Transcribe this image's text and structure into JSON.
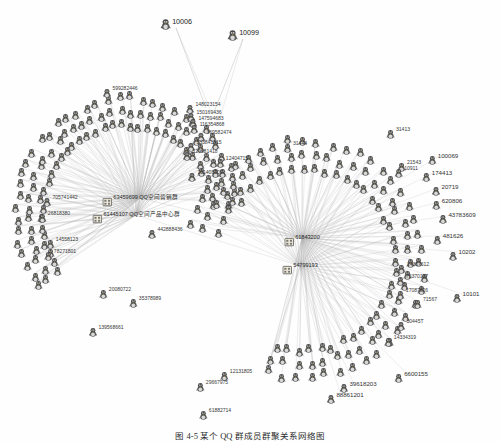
{
  "figure": {
    "type": "network-graph",
    "background": "#ffffff",
    "edge_color": "#b9b9b9",
    "node_color": "#555555",
    "label_color": "#3a3a3a",
    "caption": "图 4-5  某个 QQ 群成员群聚关系网络图"
  },
  "chart_data": {
    "type": "network",
    "layout": "two radial hub-and-spoke clusters",
    "hub_count": 4,
    "node_count": 236,
    "hubs": [
      {
        "id": "63459699",
        "label": "63459699  QQ空间营销群",
        "x": 140,
        "y": 198,
        "cluster": "left"
      },
      {
        "id": "61445107",
        "label": "61445107  QQ空间产品中心群",
        "x": 136,
        "y": 215,
        "cluster": "left"
      },
      {
        "id": "61843200",
        "label": "61843200",
        "x": 302,
        "y": 238,
        "cluster": "right"
      },
      {
        "id": "54799193",
        "label": "54799193",
        "x": 300,
        "y": 266,
        "cluster": "right"
      }
    ],
    "isolated_top": [
      {
        "id": "10006",
        "x": 176,
        "y": 22
      },
      {
        "id": "10099",
        "x": 243,
        "y": 33
      }
    ],
    "labelled_peripheral": [
      "599282446",
      "148023154",
      "150169436",
      "147594683",
      "116354868",
      "369582474",
      "133841815",
      "129681418",
      "151408709",
      "12404715",
      "442888436",
      "139568661",
      "61882714",
      "6600155",
      "39618203",
      "88861201",
      "10202",
      "10101",
      "481626",
      "174413",
      "20719",
      "620806",
      "100069",
      "21543",
      "10911",
      "31413",
      "31444",
      "14367612",
      "75370197",
      "17087826",
      "71567",
      "30445T",
      "26818380",
      "705741442",
      "14558123",
      "78271801",
      "13231",
      "20080722",
      "35378989",
      "12131805",
      "29667975",
      "47264B",
      "61882714",
      "43783609",
      "14334319"
    ],
    "legend": [],
    "axis": "none",
    "grid": false
  },
  "nodes": [
    {
      "n": "10006",
      "x": 176,
      "y": 22,
      "k": "top"
    },
    {
      "n": "10099",
      "x": 243,
      "y": 33,
      "k": "top"
    },
    {
      "n": "599282446",
      "x": 120,
      "y": 89,
      "k": "p"
    },
    {
      "n": "148023154",
      "x": 203,
      "y": 105,
      "k": "p"
    },
    {
      "n": "150169436",
      "x": 204,
      "y": 113,
      "k": "p"
    },
    {
      "n": "147594683",
      "x": 206,
      "y": 119,
      "k": "p"
    },
    {
      "n": "116354868",
      "x": 207,
      "y": 125,
      "k": "p"
    },
    {
      "n": "369582474",
      "x": 214,
      "y": 133,
      "k": "p"
    },
    {
      "n": "133841815",
      "x": 204,
      "y": 143,
      "k": "p"
    },
    {
      "n": "129681418",
      "x": 200,
      "y": 152,
      "k": "p"
    },
    {
      "n": "151408709",
      "x": 205,
      "y": 173,
      "k": "p"
    },
    {
      "n": "12404715",
      "x": 232,
      "y": 159,
      "k": "p"
    },
    {
      "n": "442888436",
      "x": 165,
      "y": 230,
      "k": "p"
    },
    {
      "n": "139568661",
      "x": 106,
      "y": 328,
      "k": "p"
    },
    {
      "n": "26818380",
      "x": 54,
      "y": 214,
      "k": "p"
    },
    {
      "n": "705741442",
      "x": 60,
      "y": 198,
      "k": "p"
    },
    {
      "n": "14558123",
      "x": 62,
      "y": 240,
      "k": "p"
    },
    {
      "n": "78271801",
      "x": 60,
      "y": 252,
      "k": "p"
    },
    {
      "n": "20080722",
      "x": 115,
      "y": 290,
      "k": "p"
    },
    {
      "n": "35378989",
      "x": 145,
      "y": 299,
      "k": "p"
    },
    {
      "n": "12131805",
      "x": 236,
      "y": 372,
      "k": "p"
    },
    {
      "n": "29667975",
      "x": 212,
      "y": 383,
      "k": "p"
    },
    {
      "n": "61882714",
      "x": 215,
      "y": 411,
      "k": "p"
    },
    {
      "n": "100069",
      "x": 443,
      "y": 156,
      "k": "iso"
    },
    {
      "n": "174413",
      "x": 437,
      "y": 173,
      "k": "iso"
    },
    {
      "n": "20719",
      "x": 445,
      "y": 187,
      "k": "iso"
    },
    {
      "n": "620806",
      "x": 447,
      "y": 201,
      "k": "iso"
    },
    {
      "n": "43783609",
      "x": 457,
      "y": 215,
      "k": "iso"
    },
    {
      "n": "481626",
      "x": 448,
      "y": 236,
      "k": "iso"
    },
    {
      "n": "10202",
      "x": 462,
      "y": 252,
      "k": "iso"
    },
    {
      "n": "10101",
      "x": 466,
      "y": 294,
      "k": "iso"
    },
    {
      "n": "6600155",
      "x": 411,
      "y": 374,
      "k": "iso"
    },
    {
      "n": "39618203",
      "x": 358,
      "y": 384,
      "k": "iso"
    },
    {
      "n": "88861201",
      "x": 345,
      "y": 395,
      "k": "iso"
    },
    {
      "n": "31413",
      "x": 398,
      "y": 130,
      "k": "p"
    },
    {
      "n": "31444",
      "x": 295,
      "y": 144,
      "k": "p"
    },
    {
      "n": "21543",
      "x": 409,
      "y": 163,
      "k": "p"
    },
    {
      "n": "10911",
      "x": 406,
      "y": 169,
      "k": "p"
    },
    {
      "n": "14367612",
      "x": 413,
      "y": 265,
      "k": "p"
    },
    {
      "n": "75370197",
      "x": 412,
      "y": 277,
      "k": "p"
    },
    {
      "n": "17087826",
      "x": 412,
      "y": 291,
      "k": "p"
    },
    {
      "n": "71567",
      "x": 425,
      "y": 300,
      "k": "p"
    },
    {
      "n": "30445T",
      "x": 410,
      "y": 322,
      "k": "p"
    },
    {
      "n": "14334319",
      "x": 400,
      "y": 338,
      "k": "p"
    }
  ],
  "hub_nodes": [
    {
      "n": "63459699  QQ空间营销群",
      "x": 140,
      "y": 198
    },
    {
      "n": "61445107  QQ空间产品中心群",
      "x": 136,
      "y": 215
    },
    {
      "n": "61843200",
      "x": 302,
      "y": 238
    },
    {
      "n": "54799193",
      "x": 300,
      "y": 266
    }
  ],
  "caption": {
    "text": "图 4-5  某个 QQ 群成员群聚关系网络图"
  }
}
